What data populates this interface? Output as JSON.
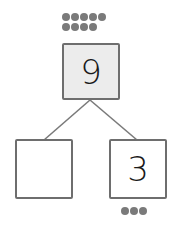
{
  "number_bond": {
    "whole": {
      "value": "9",
      "dots": 9,
      "fill": "#ececec"
    },
    "parts": [
      {
        "value": "",
        "dots": 0
      },
      {
        "value": "3",
        "dots": 3
      }
    ],
    "colors": {
      "dot": "#7a7a7a",
      "border": "#6e6e6e",
      "line": "#7a7a7a"
    }
  }
}
